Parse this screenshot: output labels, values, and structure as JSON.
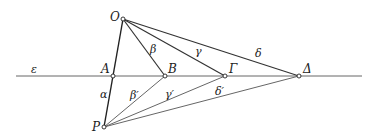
{
  "diagram": {
    "colors": {
      "line": "#555555",
      "bold_line": "#222222",
      "point_fill": "#ffffff",
      "text": "#222222"
    },
    "line_epsilon": {
      "label": "ε",
      "x1": 16,
      "y1": 76,
      "x2": 362,
      "y2": 76
    },
    "points": {
      "O": {
        "label": "O",
        "x": 123,
        "y": 19
      },
      "A": {
        "label": "A",
        "x": 113,
        "y": 76
      },
      "B": {
        "label": "B",
        "x": 165,
        "y": 76
      },
      "G": {
        "label": "Γ",
        "x": 225,
        "y": 76
      },
      "D": {
        "label": "Δ",
        "x": 299,
        "y": 76
      },
      "P": {
        "label": "P",
        "x": 104,
        "y": 127
      }
    },
    "segment_labels": {
      "alpha": "α",
      "beta": "β",
      "gamma": "γ",
      "delta": "δ",
      "beta_prime": "β′",
      "gamma_prime": "γ′",
      "delta_prime": "δ′"
    }
  }
}
